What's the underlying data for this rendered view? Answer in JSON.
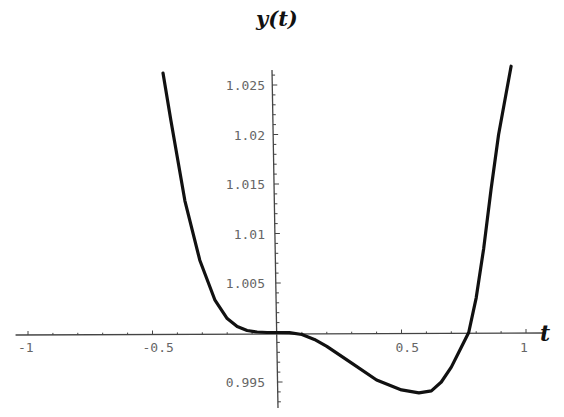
{
  "chart_data": {
    "type": "line",
    "title": "y(t)",
    "xlabel": "t",
    "ylabel": "",
    "xlim": [
      -1.0,
      1.0
    ],
    "ylim": [
      0.9935,
      1.0265
    ],
    "grid": false,
    "legend": null,
    "x_ticks": [
      -1,
      -0.5,
      0.5,
      1
    ],
    "x_tick_labels": [
      "-1",
      "-0.5",
      "0.5",
      "1"
    ],
    "y_ticks": [
      0.995,
      1.005,
      1.01,
      1.015,
      1.02,
      1.025
    ],
    "y_tick_labels": [
      "0.995",
      "1.005",
      "1.01",
      "1.015",
      "1.02",
      "1.025"
    ],
    "series": [
      {
        "name": "y(t)",
        "x": [
          -0.458,
          -0.426,
          -0.37,
          -0.31,
          -0.25,
          -0.2,
          -0.16,
          -0.12,
          -0.08,
          -0.04,
          0.0,
          0.05,
          0.1,
          0.15,
          0.2,
          0.3,
          0.4,
          0.5,
          0.57,
          0.62,
          0.66,
          0.7,
          0.74,
          0.77,
          0.8,
          0.83,
          0.86,
          0.89,
          0.94
        ],
        "values": [
          1.0262,
          1.0214,
          1.0133,
          1.0073,
          1.0033,
          1.0014,
          1.0006,
          1.0002,
          1.00005,
          1.0,
          1.0,
          0.99998,
          0.9998,
          0.9993,
          0.9986,
          0.9969,
          0.9952,
          0.9942,
          0.9939,
          0.9941,
          0.995,
          0.9965,
          0.9985,
          1.0,
          1.0035,
          1.0085,
          1.0145,
          1.02,
          1.0269
        ]
      }
    ],
    "annotations": []
  }
}
